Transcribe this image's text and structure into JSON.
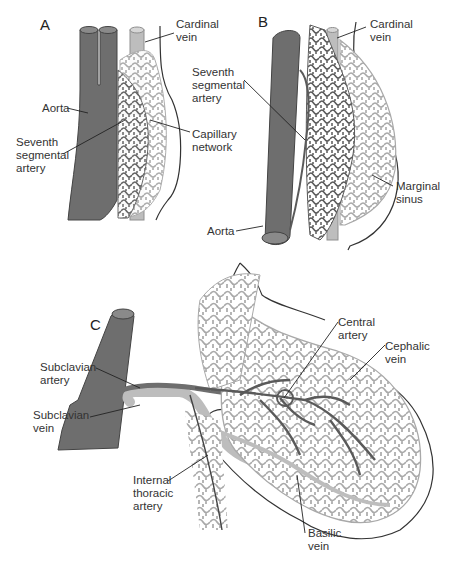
{
  "figure": {
    "colors": {
      "artery": "#6e6e6e",
      "artery_outline": "#444444",
      "vein": "#bdbdbd",
      "vein_outline": "#8f8f8f",
      "capillary_dark": "#5a5a5a",
      "capillary_light": "#a9a9a9",
      "outline": "#333333",
      "background": "#ffffff"
    },
    "panels": [
      {
        "id": "A",
        "label": "A",
        "labels": [
          {
            "text": "Cardinal\nvein",
            "name": "cardinal-vein"
          },
          {
            "text": "Aorta",
            "name": "aorta"
          },
          {
            "text": "Seventh\nsegmental\nartery",
            "name": "seventh-segmental-artery"
          },
          {
            "text": "Capillary\nnetwork",
            "name": "capillary-network"
          }
        ]
      },
      {
        "id": "B",
        "label": "B",
        "labels": [
          {
            "text": "Cardinal\nvein",
            "name": "cardinal-vein"
          },
          {
            "text": "Seventh\nsegmental\nartery",
            "name": "seventh-segmental-artery"
          },
          {
            "text": "Marginal\nsinus",
            "name": "marginal-sinus"
          },
          {
            "text": "Aorta",
            "name": "aorta"
          }
        ]
      },
      {
        "id": "C",
        "label": "C",
        "labels": [
          {
            "text": "Subclavian\nartery",
            "name": "subclavian-artery"
          },
          {
            "text": "Subclavian\nvein",
            "name": "subclavian-vein"
          },
          {
            "text": "Central\nartery",
            "name": "central-artery"
          },
          {
            "text": "Cephalic\nvein",
            "name": "cephalic-vein"
          },
          {
            "text": "Internal\nthoracic\nartery",
            "name": "internal-thoracic-artery"
          },
          {
            "text": "Basilic\nvein",
            "name": "basilic-vein"
          }
        ]
      }
    ]
  }
}
